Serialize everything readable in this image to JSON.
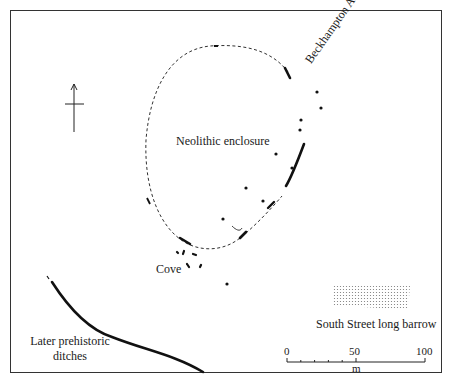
{
  "map": {
    "labels": {
      "enclosure": "Neolithic enclosure",
      "avenue": "Beckhampton Avenue",
      "cove": "Cove",
      "ditches_line1": "Later prehistoric",
      "ditches_line2": "ditches",
      "barrow": "South Street long barrow"
    },
    "north_arrow": "north-arrow-icon",
    "scale_bar": {
      "ticks": [
        "0",
        "50",
        "100"
      ],
      "unit": "m"
    },
    "colors": {
      "ink": "#1a1a1a",
      "frame": "#333333",
      "background": "#ffffff"
    }
  }
}
